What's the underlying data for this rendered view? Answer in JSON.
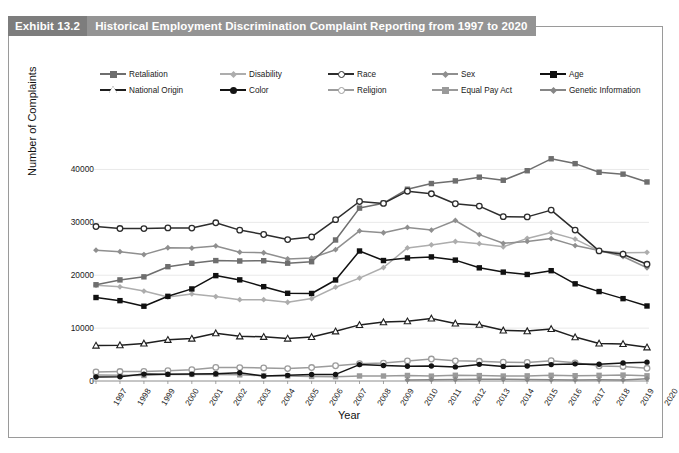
{
  "exhibit": {
    "badge": "Exhibit 13.2",
    "title": "Historical Employment Discrimination Complaint Reporting from 1997 to 2020"
  },
  "chart_data": {
    "type": "line",
    "title": "Historical Employment Discrimination Complaint Reporting from 1997 to 2020",
    "xlabel": "Year",
    "ylabel": "Number of Complaints",
    "ylim": [
      0,
      45000
    ],
    "yticks": [
      0,
      10000,
      20000,
      30000,
      40000
    ],
    "grid": true,
    "legend_position": "top",
    "categories": [
      "1997",
      "1998",
      "1999",
      "2000",
      "2001",
      "2002",
      "2003",
      "2004",
      "2005",
      "2006",
      "2007",
      "2008",
      "2009",
      "2010",
      "2011",
      "2012",
      "2013",
      "2014",
      "2015",
      "2016",
      "2017",
      "2018",
      "2019",
      "2020"
    ],
    "series": [
      {
        "name": "Retaliation",
        "marker": "square",
        "color": "#6e6e6e",
        "values": [
          18198,
          19114,
          19694,
          21613,
          22257,
          22768,
          22690,
          22740,
          22278,
          22555,
          26663,
          32690,
          33613,
          36258,
          37334,
          37836,
          38539,
          37955,
          39757,
          42018,
          41097,
          39469,
          39110,
          37632
        ]
      },
      {
        "name": "Disability",
        "marker": "diamond",
        "color": "#adadad",
        "values": [
          18108,
          17806,
          17007,
          15864,
          16470,
          15964,
          15377,
          15376,
          14893,
          15575,
          17734,
          19453,
          21451,
          25165,
          25742,
          26379,
          25957,
          25369,
          26968,
          28073,
          26838,
          24605,
          24238,
          24324
        ]
      },
      {
        "name": "Race",
        "marker": "circle-open",
        "color": "#2d2d2d",
        "values": [
          29199,
          28820,
          28819,
          28945,
          28912,
          29910,
          28526,
          27696,
          26740,
          27238,
          30510,
          33937,
          33579,
          35890,
          35395,
          33512,
          33068,
          31073,
          31027,
          32309,
          28528,
          24600,
          23976,
          22064
        ]
      },
      {
        "name": "Sex",
        "marker": "diamond",
        "color": "#8f8f8f",
        "values": [
          24728,
          24454,
          23907,
          25194,
          25140,
          25536,
          24362,
          24249,
          23094,
          23247,
          24826,
          28372,
          28028,
          29029,
          28534,
          30356,
          27687,
          26027,
          26396,
          26934,
          25605,
          24655,
          23532,
          21398
        ]
      },
      {
        "name": "Age",
        "marker": "square-filled",
        "color": "#111111",
        "values": [
          15785,
          15191,
          14141,
          16008,
          17405,
          19921,
          19124,
          17837,
          16585,
          16548,
          19103,
          24582,
          22778,
          23264,
          23465,
          22857,
          21396,
          20588,
          20144,
          20857,
          18376,
          16911,
          15573,
          14183
        ]
      },
      {
        "name": "National Origin",
        "marker": "triangle-open",
        "color": "#1f1f1f",
        "values": [
          6712,
          6778,
          7108,
          7792,
          8025,
          9046,
          8450,
          8361,
          8035,
          8327,
          9396,
          10601,
          11134,
          11304,
          11833,
          10883,
          10642,
          9579,
          9438,
          9840,
          8299,
          7106,
          7009,
          6377
        ]
      },
      {
        "name": "Color",
        "marker": "circle-filled",
        "color": "#141414",
        "values": [
          762,
          809,
          1303,
          1290,
          1303,
          1381,
          1550,
          931,
          1069,
          1241,
          1241,
          3102,
          2943,
          2780,
          2832,
          2662,
          3146,
          2756,
          2833,
          3102,
          3240,
          3166,
          3415,
          3562
        ]
      },
      {
        "name": "Religion",
        "marker": "circle-open-light",
        "color": "#9c9c9c",
        "values": [
          1709,
          1786,
          1811,
          1939,
          2127,
          2572,
          2532,
          2466,
          2340,
          2541,
          2880,
          3273,
          3386,
          3790,
          4151,
          3811,
          3721,
          3549,
          3502,
          3825,
          3436,
          2859,
          2725,
          2404
        ]
      },
      {
        "name": "Equal Pay Act",
        "marker": "square",
        "color": "#9a9a9a",
        "values": [
          1134,
          1071,
          1044,
          1270,
          1251,
          1256,
          1167,
          1011,
          970,
          861,
          818,
          954,
          942,
          1044,
          919,
          1082,
          1019,
          938,
          973,
          1075,
          996,
          1066,
          1117,
          980
        ]
      },
      {
        "name": "Genetic Information",
        "marker": "diamond",
        "color": "#868686",
        "values": [
          0,
          0,
          0,
          0,
          0,
          0,
          0,
          0,
          0,
          0,
          0,
          0,
          0,
          201,
          245,
          280,
          333,
          333,
          257,
          238,
          206,
          220,
          209,
          440
        ]
      }
    ]
  }
}
